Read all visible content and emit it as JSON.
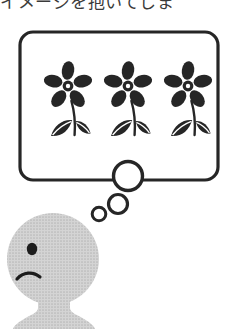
{
  "image": {
    "width": 226,
    "height": 329,
    "background_color": "#ffffff",
    "style": "black-and-white line-art cartoon illustration"
  },
  "caption": {
    "text": "イメージを抱いてしま",
    "language": "japanese",
    "cropped": "top and right edges cut off",
    "color": "#3a3a3a"
  },
  "thought_bubble": {
    "shape": "rounded-rectangle",
    "x": 20,
    "y": 32,
    "width": 198,
    "height": 148,
    "corner_radius": 13,
    "stroke_color": "#262626",
    "stroke_width": 3.2,
    "fill_color": "#ffffff"
  },
  "thought_trail": {
    "circles": [
      {
        "name": "large-thought-circle",
        "cx": 128,
        "cy": 176,
        "r": 14.5,
        "stroke_width": 3.4
      },
      {
        "name": "medium-thought-circle",
        "cx": 118,
        "cy": 204,
        "r": 9.5,
        "stroke_width": 3.2
      },
      {
        "name": "small-thought-circle",
        "cx": 99,
        "cy": 214,
        "r": 6.8,
        "stroke_width": 3.0
      }
    ],
    "stroke_color": "#262626",
    "fill_color": "#ffffff"
  },
  "flowers": {
    "count": 3,
    "petals_per_flower": 5,
    "leaves_per_flower": 2,
    "color": "#262626",
    "items": [
      {
        "name": "flower-left",
        "cx": 68,
        "cy": 86
      },
      {
        "name": "flower-middle",
        "cx": 128,
        "cy": 86
      },
      {
        "name": "flower-right",
        "cx": 188,
        "cy": 86
      }
    ]
  },
  "character": {
    "name": "thinking-person",
    "expression": "worried",
    "head": {
      "cx": 53,
      "cy": 259,
      "r": 46,
      "fill": "#c9c9c9"
    },
    "body": {
      "fill": "#c9c9c9"
    },
    "eye": {
      "cx": 32,
      "cy": 249,
      "rx": 5.2,
      "ry": 6.2,
      "fill": "#1c1c1c"
    },
    "mouth": {
      "shape": "frown-arc",
      "stroke": "#1c1c1c",
      "stroke_width": 3.2
    }
  }
}
